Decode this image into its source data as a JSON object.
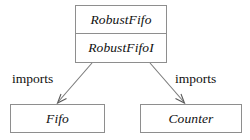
{
  "diagram": {
    "type": "module-dependency-diagram",
    "background_color": "#ffffff",
    "border_color": "#8e8e8e",
    "line_color": "#7a7a7a",
    "text_color": "#101010",
    "nodes": [
      {
        "id": "robustfifo",
        "compartments": [
          "RobustFifo",
          "RobustFifoI"
        ]
      },
      {
        "id": "fifo",
        "compartments": [
          "Fifo"
        ]
      },
      {
        "id": "counter",
        "compartments": [
          "Counter"
        ]
      }
    ],
    "edges": [
      {
        "id": "robustfifo-to-fifo",
        "from": "robustfifo",
        "to": "fifo",
        "label": "imports",
        "arrowhead": "open"
      },
      {
        "id": "robustfifo-to-counter",
        "from": "robustfifo",
        "to": "counter",
        "label": "imports",
        "arrowhead": "open"
      }
    ]
  }
}
